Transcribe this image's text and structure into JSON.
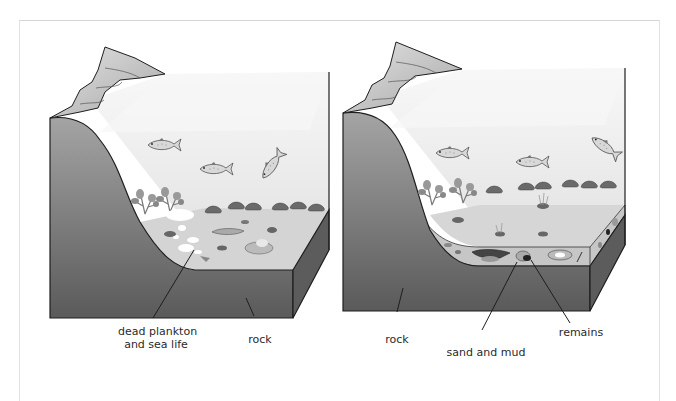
{
  "figure": {
    "panels": [
      {
        "id": "left",
        "description": "Dead plankton and sea life settling on the sea floor",
        "labels": {
          "dead_plankton_line1": "dead plankton",
          "dead_plankton_line2": "and sea life",
          "rock": "rock"
        }
      },
      {
        "id": "right",
        "description": "Remains buried under layers of sand and mud",
        "labels": {
          "rock": "rock",
          "sand_and_mud": "sand and mud",
          "remains": "remains"
        }
      }
    ]
  },
  "colors": {
    "rock_dark": "#5e5e5e",
    "rock_light": "#9a9a9a",
    "water": "#ececec",
    "seabed": "#d2d2d2",
    "sediment": "#c4c4c4",
    "outline": "#1e1e1e",
    "cliff": "#c8c8c8"
  }
}
